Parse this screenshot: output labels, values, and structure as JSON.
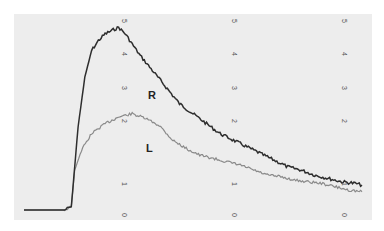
{
  "chart_data": {
    "type": "line",
    "title": "",
    "xlabel": "",
    "ylabel": "",
    "ylim": [
      0,
      5
    ],
    "y_ticks": [
      "0",
      "1",
      "2",
      "3",
      "4",
      "5"
    ],
    "tick_columns": 3,
    "grid": false,
    "legend": "inline labels",
    "series": [
      {
        "name": "R",
        "color": "#333333",
        "points": [
          [
            0,
            0
          ],
          [
            12,
            0
          ],
          [
            14,
            0.1
          ],
          [
            16,
            2.5
          ],
          [
            18,
            4.0
          ],
          [
            20,
            4.8
          ],
          [
            22,
            5.1
          ],
          [
            24,
            5.3
          ],
          [
            26,
            5.4
          ],
          [
            28,
            5.5
          ],
          [
            30,
            5.3
          ],
          [
            32,
            5.0
          ],
          [
            34,
            4.7
          ],
          [
            38,
            4.2
          ],
          [
            42,
            3.7
          ],
          [
            46,
            3.2
          ],
          [
            50,
            2.9
          ],
          [
            54,
            2.6
          ],
          [
            58,
            2.3
          ],
          [
            62,
            2.1
          ],
          [
            66,
            1.9
          ],
          [
            70,
            1.7
          ],
          [
            74,
            1.5
          ],
          [
            78,
            1.3
          ],
          [
            82,
            1.2
          ],
          [
            86,
            1.05
          ],
          [
            90,
            0.95
          ],
          [
            94,
            0.85
          ],
          [
            98,
            0.8
          ],
          [
            100,
            0.75
          ]
        ]
      },
      {
        "name": "L",
        "color": "#888888",
        "points": [
          [
            0,
            0
          ],
          [
            12,
            0
          ],
          [
            14,
            0.1
          ],
          [
            15,
            1.2
          ],
          [
            17,
            1.8
          ],
          [
            20,
            2.3
          ],
          [
            24,
            2.6
          ],
          [
            28,
            2.8
          ],
          [
            32,
            2.9
          ],
          [
            36,
            2.75
          ],
          [
            40,
            2.55
          ],
          [
            44,
            2.1
          ],
          [
            48,
            1.85
          ],
          [
            52,
            1.65
          ],
          [
            56,
            1.55
          ],
          [
            60,
            1.45
          ],
          [
            64,
            1.35
          ],
          [
            68,
            1.2
          ],
          [
            72,
            1.05
          ],
          [
            76,
            1.0
          ],
          [
            80,
            0.9
          ],
          [
            84,
            0.85
          ],
          [
            88,
            0.8
          ],
          [
            92,
            0.7
          ],
          [
            96,
            0.6
          ],
          [
            100,
            0.55
          ]
        ]
      }
    ]
  },
  "labels": {
    "r": "R",
    "l": "L"
  }
}
